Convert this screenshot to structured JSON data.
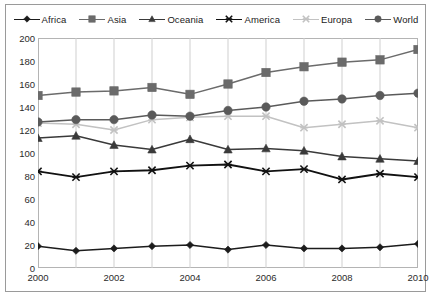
{
  "chart_data": {
    "type": "line",
    "title": "",
    "subtitle": "",
    "xlabel": "",
    "ylabel": "",
    "x": [
      2000,
      2001,
      2002,
      2003,
      2004,
      2005,
      2006,
      2007,
      2008,
      2009,
      2010
    ],
    "xlim": [
      2000,
      2010
    ],
    "ylim": [
      0,
      200
    ],
    "ytick_step": 20,
    "xtick_labels": [
      "2000",
      "2002",
      "2004",
      "2006",
      "2008",
      "2010"
    ],
    "xtick_values": [
      2000,
      2002,
      2004,
      2006,
      2008,
      2010
    ],
    "ytick_labels": [
      "0",
      "20",
      "40",
      "60",
      "80",
      "100",
      "120",
      "140",
      "160",
      "180",
      "200"
    ],
    "ytick_values": [
      0,
      20,
      40,
      60,
      80,
      100,
      120,
      140,
      160,
      180,
      200
    ],
    "grid": "vertical",
    "legend_position": "top",
    "series": [
      {
        "name": "Africa",
        "marker": "diamond",
        "color": "#1c1c1c",
        "values": [
          19,
          15,
          17,
          19,
          20,
          16,
          20,
          17,
          17,
          18,
          21
        ]
      },
      {
        "name": "Asia",
        "marker": "square",
        "color": "#6b6b6b",
        "values": [
          150,
          153,
          154,
          157,
          151,
          160,
          170,
          175,
          179,
          181,
          190
        ]
      },
      {
        "name": "Oceania",
        "marker": "triangle",
        "color": "#3a3a3a",
        "values": [
          113,
          115,
          107,
          103,
          112,
          103,
          104,
          102,
          97,
          95,
          93
        ]
      },
      {
        "name": "America",
        "marker": "x",
        "color": "#111111",
        "values": [
          84,
          79,
          84,
          85,
          89,
          90,
          84,
          86,
          77,
          82,
          79
        ]
      },
      {
        "name": "Europa",
        "marker": "x",
        "color": "#c2c2c2",
        "values": [
          126,
          125,
          120,
          129,
          131,
          132,
          132,
          122,
          125,
          128,
          122
        ]
      },
      {
        "name": "World",
        "marker": "circle",
        "color": "#5a5a5a",
        "values": [
          127,
          129,
          129,
          133,
          132,
          137,
          140,
          145,
          147,
          150,
          152
        ]
      }
    ]
  }
}
